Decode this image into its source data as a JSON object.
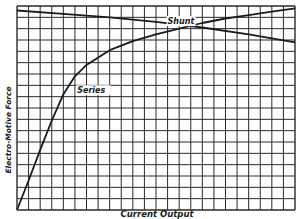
{
  "chart_data": {
    "type": "line",
    "title": "",
    "xlabel": "Current Output",
    "ylabel": "Electro-Motive Force",
    "grid": true,
    "grid_columns": 24,
    "grid_rows": 18,
    "xlim": [
      0,
      24
    ],
    "ylim": [
      0,
      18
    ],
    "legend": "inline labels",
    "series": [
      {
        "name": "Shunt",
        "label_position": [
          13,
          16.4
        ],
        "x": [
          0,
          4,
          8,
          12,
          16,
          20,
          24
        ],
        "y": [
          17.6,
          17.3,
          17.0,
          16.6,
          16.1,
          15.5,
          14.8
        ]
      },
      {
        "name": "Series",
        "label_position": [
          5.2,
          10.3
        ],
        "x": [
          0,
          1,
          2,
          3,
          4,
          5,
          6,
          8,
          10,
          12,
          14,
          16,
          18,
          20,
          22,
          24
        ],
        "y": [
          0,
          2.6,
          5.3,
          7.9,
          10.2,
          11.8,
          12.8,
          14.1,
          14.9,
          15.5,
          16.0,
          16.5,
          16.9,
          17.2,
          17.5,
          17.8
        ]
      }
    ],
    "annotations": [
      {
        "text": "Shunt",
        "attached_to": "Shunt"
      },
      {
        "text": "Series",
        "attached_to": "Series"
      }
    ],
    "colors": {
      "grid": "#2a2a2a",
      "line": "#1a1a1a",
      "background": "#ffffff"
    }
  }
}
